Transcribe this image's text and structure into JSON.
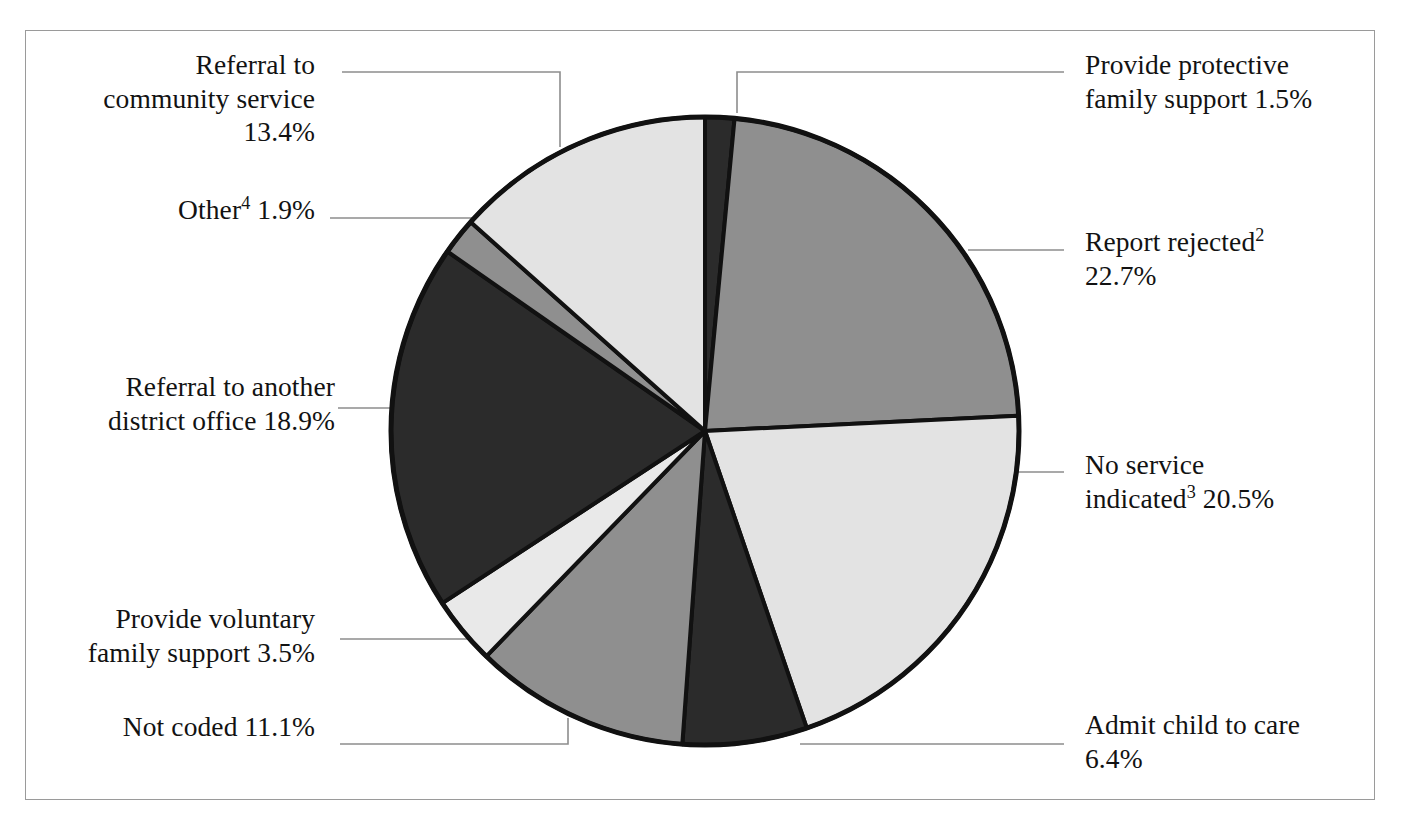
{
  "chart_data": {
    "type": "pie",
    "title": "",
    "subtitle": "",
    "xlabel": "",
    "ylabel": "",
    "legend_position": "callout-labels",
    "grid": false,
    "units": "percent",
    "start_angle_deg": 0,
    "direction": "clockwise",
    "categories": [
      "Provide protective family support",
      "Report rejected",
      "No service indicated",
      "Admit child to care",
      "Not coded",
      "Provide voluntary family support",
      "Referral to another district office",
      "Other",
      "Referral to community service"
    ],
    "values": [
      1.5,
      22.7,
      20.5,
      6.4,
      11.1,
      3.5,
      18.9,
      1.9,
      13.4
    ],
    "colors": [
      "#2b2b2b",
      "#8f8f8f",
      "#e3e3e3",
      "#2b2b2b",
      "#8f8f8f",
      "#e9e9e9",
      "#2b2b2b",
      "#8f8f8f",
      "#e3e3e3"
    ],
    "slices": [
      {
        "label": "Provide protective family support",
        "value": 1.5,
        "display": "1.5%",
        "color": "#2b2b2b"
      },
      {
        "label": "Report rejected",
        "value": 22.7,
        "display": "22.7%",
        "color": "#8f8f8f"
      },
      {
        "label": "No service indicated",
        "value": 20.5,
        "display": "20.5%",
        "color": "#e3e3e3"
      },
      {
        "label": "Admit child to care",
        "value": 6.4,
        "display": "6.4%",
        "color": "#2b2b2b"
      },
      {
        "label": "Not coded",
        "value": 11.1,
        "display": "11.1%",
        "color": "#8f8f8f"
      },
      {
        "label": "Provide voluntary family support",
        "value": 3.5,
        "display": "3.5%",
        "color": "#e9e9e9"
      },
      {
        "label": "Referral to another district office",
        "value": 18.9,
        "display": "18.9%",
        "color": "#2b2b2b"
      },
      {
        "label": "Other",
        "value": 1.9,
        "display": "1.9%",
        "color": "#8f8f8f"
      },
      {
        "label": "Referral to community service",
        "value": 13.4,
        "display": "13.4%",
        "color": "#e3e3e3"
      }
    ]
  },
  "labels": {
    "referral_community": {
      "line1": "Referral to",
      "line2": "community service",
      "line3": "13.4%",
      "text": "Referral to\ncommunity service\n13.4%"
    },
    "other": {
      "text_before_sup": "Other",
      "sup": "4",
      "text_after_sup": " 1.9%"
    },
    "referral_district": {
      "text": "Referral to another\ndistrict office 18.9%"
    },
    "provide_voluntary": {
      "text": "Provide voluntary\nfamily support 3.5%"
    },
    "not_coded": {
      "text": "Not coded 11.1%"
    },
    "provide_protective": {
      "text": "Provide protective\nfamily support 1.5%"
    },
    "report_rejected": {
      "text_before_sup": "Report rejected",
      "sup": "2",
      "text_after_sup": "\n22.7%"
    },
    "no_service": {
      "text_before_sup": "No service\nindicated",
      "sup": "3",
      "text_after_sup": " 20.5%"
    },
    "admit_child": {
      "text": "Admit child to care\n6.4%"
    }
  },
  "style": {
    "frame_color": "#9a9a9a",
    "leader_color": "#8d8d8d",
    "pie_outline": "#111111",
    "background": "#ffffff"
  }
}
